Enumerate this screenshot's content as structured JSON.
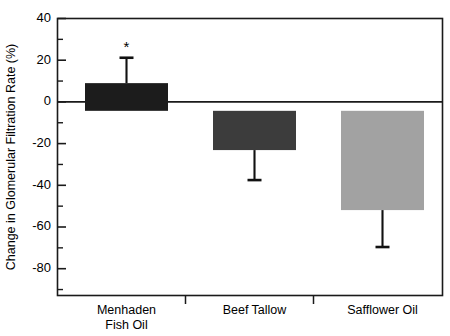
{
  "chart_data": {
    "type": "bar",
    "title": "",
    "xlabel": "",
    "ylabel": "Change in Glomerular Filtration Rate (%)",
    "categories": [
      "Menhaden Fish Oil",
      "Beef Tallow",
      "Safflower Oil"
    ],
    "category_lines": [
      [
        "Menhaden",
        "Fish Oil"
      ],
      [
        "Beef Tallow"
      ],
      [
        "Safflower Oil"
      ]
    ],
    "values": [
      12,
      -17,
      -43
    ],
    "errors": [
      11,
      13,
      16
    ],
    "error_direction": [
      "up",
      "down",
      "down"
    ],
    "significance_markers": [
      "*",
      "",
      ""
    ],
    "bar_colors": [
      "#1c1c1c",
      "#3c3c3c",
      "#a2a2a2"
    ],
    "ylim": [
      -80,
      40
    ],
    "ytick_labels": [
      "40",
      "20",
      "0",
      "-20",
      "-40",
      "-60",
      "-80"
    ],
    "ytick_values": [
      40,
      20,
      0,
      -20,
      -40,
      -60,
      -80
    ],
    "yminor_values": [
      30,
      10,
      -10,
      -30,
      -50,
      -70
    ],
    "grid": false,
    "legend": "none",
    "zero_reference_line": 0
  },
  "axis": {
    "y_axis_title": "Change in Glomerular Filtration Rate (%)"
  },
  "marks": {
    "asterisk": "*"
  }
}
